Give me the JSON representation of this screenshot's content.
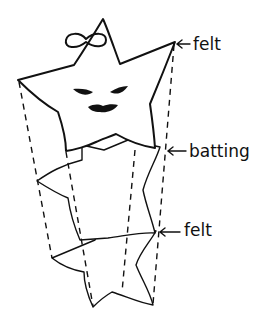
{
  "diagram": {
    "title": "",
    "layers": [
      {
        "id": "top-felt",
        "label": "felt"
      },
      {
        "id": "batting",
        "label": "batting"
      },
      {
        "id": "bottom-felt",
        "label": "felt"
      }
    ],
    "features": {
      "top_layer_face": [
        "eyes",
        "mouth"
      ],
      "top_layer_decoration": "bow"
    },
    "connector_style": "dashed"
  }
}
